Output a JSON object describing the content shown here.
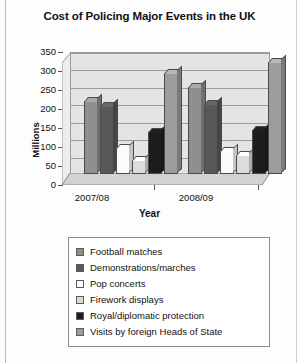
{
  "chart_data": {
    "type": "bar",
    "title": "Cost of Policing Major Events in the UK",
    "xlabel": "Year",
    "ylabel": "Millions",
    "categories": [
      "2007/08",
      "2008/09"
    ],
    "yticks": [
      350,
      300,
      250,
      200,
      150,
      100,
      50,
      0
    ],
    "ylim": [
      0,
      350
    ],
    "grid": true,
    "legend_position": "bottom",
    "style": "3d-clustered-column",
    "series": [
      {
        "name": "Football matches",
        "color": "#8f8f8f",
        "values": [
          210,
          250
        ]
      },
      {
        "name": "Demonstrations/marches",
        "color": "#585858",
        "values": [
          195,
          200
        ]
      },
      {
        "name": "Pop concerts",
        "color": "#fcfcfc",
        "values": [
          75,
          65
        ]
      },
      {
        "name": "Firework displays",
        "color": "#dcdcdc",
        "values": [
          40,
          55
        ]
      },
      {
        "name": "Royal/diplomatic protection",
        "color": "#1c1c1c",
        "values": [
          120,
          125
        ]
      },
      {
        "name": "Visits by foreign Heads of State",
        "color": "#9c9c9c",
        "values": [
          290,
          320
        ]
      }
    ]
  }
}
